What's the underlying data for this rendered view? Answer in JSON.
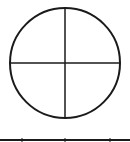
{
  "diagram": {
    "type": "quartered-circle",
    "stroke_color": "#1a1a1a",
    "background": "#ffffff",
    "circle": {
      "cx": 65,
      "cy": 63,
      "r": 55
    },
    "baseline": {
      "y": 140,
      "ticks_x": [
        22,
        65,
        110
      ]
    }
  }
}
